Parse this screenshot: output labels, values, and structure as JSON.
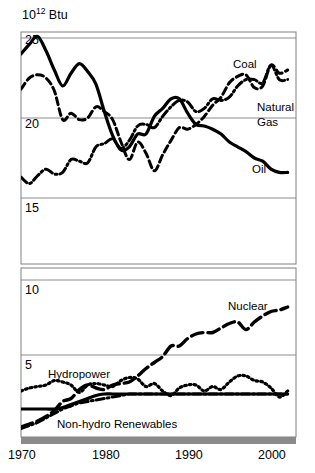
{
  "figure": {
    "unit_title": "10",
    "unit_exponent": "12",
    "unit_suffix": " Btu"
  },
  "chart_data": {
    "type": "line",
    "xlabel": "",
    "ylabel": "10^12 Btu",
    "grid": true,
    "legend": "inline-labels",
    "xlim": [
      1970,
      2003
    ],
    "x_ticks": [
      1970,
      1980,
      1990,
      2000
    ],
    "y_ticks_upper": [
      25,
      20,
      15
    ],
    "y_ticks_lower": [
      10,
      5
    ],
    "axis_break": true,
    "panels": [
      {
        "name": "upper",
        "ylim": [
          13.2,
          26.6
        ],
        "gridlines": [
          25,
          20,
          15
        ]
      },
      {
        "name": "lower",
        "ylim": [
          0.0,
          11.2
        ],
        "gridlines": [
          10,
          5
        ]
      }
    ],
    "x": [
      1970,
      1971,
      1972,
      1973,
      1974,
      1975,
      1976,
      1977,
      1978,
      1979,
      1980,
      1981,
      1982,
      1983,
      1984,
      1985,
      1986,
      1987,
      1988,
      1989,
      1990,
      1991,
      1992,
      1993,
      1994,
      1995,
      1996,
      1997,
      1998,
      1999,
      2000,
      2001,
      2002
    ],
    "series": [
      {
        "name": "Coal",
        "label": "Coal",
        "style": "dash-dot",
        "panel": "upper",
        "values": [
          12.7,
          12.0,
          12.4,
          13.2,
          12.9,
          12.7,
          13.6,
          13.9,
          13.8,
          15.0,
          15.4,
          16.0,
          15.3,
          15.9,
          17.1,
          17.5,
          17.3,
          18.0,
          18.8,
          19.1,
          19.2,
          18.8,
          19.1,
          19.8,
          19.9,
          20.1,
          21.0,
          21.4,
          21.6,
          21.6,
          22.6,
          21.9,
          21.9
        ],
        "display_values": [
          16.3,
          15.9,
          16.4,
          16.8,
          16.5,
          16.6,
          17.4,
          17.3,
          17.2,
          18.2,
          18.4,
          18.7,
          18.1,
          18.6,
          19.5,
          19.6,
          19.4,
          20.1,
          20.7,
          21.1,
          21.0,
          20.4,
          20.6,
          21.2,
          21.1,
          21.3,
          22.0,
          22.4,
          22.4,
          22.2,
          23.3,
          22.4,
          22.4
        ]
      },
      {
        "name": "Natural Gas",
        "label": "Natural Gas",
        "style": "dashed",
        "panel": "upper",
        "values": [
          21.8,
          22.5,
          22.7,
          22.5,
          21.7,
          19.9,
          20.3,
          19.9,
          20.0,
          20.7,
          20.4,
          19.9,
          18.5,
          17.4,
          18.5,
          17.8,
          16.7,
          17.7,
          18.6,
          19.4,
          19.3,
          19.6,
          20.1,
          20.8,
          21.3,
          22.2,
          22.6,
          22.7,
          21.9,
          22.0,
          23.3,
          22.8,
          23.0
        ],
        "display_values": [
          21.8,
          22.5,
          22.7,
          22.5,
          21.7,
          19.9,
          20.3,
          19.9,
          20.0,
          20.7,
          20.4,
          19.9,
          18.5,
          17.4,
          18.5,
          17.8,
          16.7,
          17.7,
          18.6,
          19.4,
          19.3,
          19.6,
          20.1,
          20.8,
          21.3,
          22.2,
          22.6,
          22.7,
          21.9,
          22.0,
          23.3,
          22.8,
          23.0
        ]
      },
      {
        "name": "Oil",
        "label": "Oil",
        "style": "solid",
        "panel": "upper",
        "values": [
          24.0,
          24.6,
          25.1,
          24.2,
          23.0,
          22.0,
          22.8,
          23.4,
          22.9,
          22.1,
          20.4,
          18.9,
          18.0,
          18.2,
          19.0,
          19.0,
          20.1,
          20.6,
          21.2,
          21.2,
          20.3,
          19.6,
          19.5,
          19.3,
          19.0,
          18.5,
          18.2,
          17.9,
          17.5,
          17.3,
          16.8,
          16.6,
          16.6
        ],
        "display_values": [
          24.0,
          24.6,
          25.1,
          24.2,
          23.0,
          22.0,
          22.8,
          23.4,
          22.9,
          22.1,
          20.4,
          18.9,
          18.0,
          18.2,
          19.0,
          19.0,
          20.1,
          20.6,
          21.2,
          21.2,
          20.3,
          19.6,
          19.5,
          19.3,
          19.0,
          18.5,
          18.2,
          17.9,
          17.5,
          17.3,
          16.8,
          16.6,
          16.6
        ]
      },
      {
        "name": "Nuclear",
        "label": "Nuclear",
        "style": "long-dash",
        "panel": "lower",
        "values": [
          0.2,
          0.4,
          0.6,
          0.9,
          1.3,
          1.9,
          2.1,
          2.7,
          3.0,
          2.8,
          2.7,
          3.0,
          3.1,
          3.2,
          3.6,
          4.1,
          4.5,
          4.9,
          5.6,
          5.6,
          6.1,
          6.4,
          6.5,
          6.5,
          6.8,
          7.1,
          7.2,
          6.7,
          7.2,
          7.6,
          7.9,
          8.0,
          8.2
        ],
        "display_values": [
          0.2,
          0.4,
          0.6,
          0.9,
          1.3,
          1.9,
          2.1,
          2.7,
          3.0,
          2.8,
          2.7,
          3.0,
          3.1,
          3.2,
          3.6,
          4.1,
          4.5,
          4.9,
          5.6,
          5.6,
          6.1,
          6.4,
          6.5,
          6.5,
          6.8,
          7.1,
          7.2,
          6.7,
          7.2,
          7.6,
          7.9,
          8.0,
          8.2
        ]
      },
      {
        "name": "Hydropower",
        "label": "Hydropower",
        "style": "dotted",
        "panel": "lower",
        "values": [
          2.6,
          2.8,
          2.9,
          3.0,
          3.3,
          3.2,
          3.0,
          2.5,
          3.0,
          3.1,
          3.0,
          2.9,
          3.3,
          3.5,
          3.4,
          2.9,
          3.1,
          2.6,
          2.3,
          2.8,
          3.0,
          3.0,
          2.6,
          2.9,
          2.7,
          3.2,
          3.6,
          3.6,
          3.3,
          3.2,
          2.8,
          2.2,
          2.6
        ],
        "display_values": [
          2.6,
          2.8,
          2.9,
          3.0,
          3.3,
          3.2,
          3.0,
          2.5,
          3.0,
          3.1,
          3.0,
          2.9,
          3.3,
          3.5,
          3.4,
          2.9,
          3.1,
          2.6,
          2.3,
          2.8,
          3.0,
          3.0,
          2.6,
          2.9,
          2.7,
          3.2,
          3.6,
          3.6,
          3.3,
          3.2,
          2.8,
          2.2,
          2.6
        ]
      },
      {
        "name": "Non-hydro Renewables",
        "label": "Non-hydro Renewables",
        "style": "dash-dot",
        "panel": "lower",
        "values": [
          0.1,
          0.3,
          0.5,
          0.8,
          1.1,
          1.4,
          1.6,
          1.8,
          1.9,
          2.0,
          2.1,
          2.2,
          2.3,
          2.4,
          2.4,
          2.4,
          2.4,
          2.4,
          2.4,
          2.4,
          2.4,
          2.4,
          2.4,
          2.4,
          2.4,
          2.4,
          2.4,
          2.4,
          2.4,
          2.4,
          2.4,
          2.4,
          2.4
        ],
        "display_values": [
          0.1,
          0.3,
          0.5,
          0.8,
          1.1,
          1.4,
          1.6,
          1.8,
          1.9,
          2.0,
          2.1,
          2.2,
          2.3,
          2.4,
          2.4,
          2.4,
          2.4,
          2.4,
          2.4,
          2.4,
          2.4,
          2.4,
          2.4,
          2.4,
          2.4,
          2.4,
          2.4,
          2.4,
          2.4,
          2.4,
          2.4,
          2.4,
          2.4
        ]
      },
      {
        "name": "Other (solid lower)",
        "label": "",
        "style": "solid",
        "panel": "lower",
        "values": [
          1.4,
          1.4,
          1.4,
          1.4,
          1.4,
          1.5,
          1.7,
          1.9,
          2.1,
          2.3,
          2.4,
          2.4,
          2.4,
          2.4,
          2.4,
          2.4,
          2.4,
          2.4,
          2.4,
          2.4,
          2.4,
          2.4,
          2.4,
          2.4,
          2.4,
          2.4,
          2.4,
          2.4,
          2.4,
          2.4,
          2.4,
          2.4,
          2.4
        ],
        "display_values": [
          1.4,
          1.4,
          1.4,
          1.4,
          1.4,
          1.5,
          1.7,
          1.9,
          2.1,
          2.3,
          2.4,
          2.4,
          2.4,
          2.4,
          2.4,
          2.4,
          2.4,
          2.4,
          2.4,
          2.4,
          2.4,
          2.4,
          2.4,
          2.4,
          2.4,
          2.4,
          2.4,
          2.4,
          2.4,
          2.4,
          2.4,
          2.4,
          2.4
        ]
      }
    ],
    "y_axis_labels": [
      {
        "text": "25",
        "value": 25,
        "panel": "upper"
      },
      {
        "text": "20",
        "value": 20,
        "panel": "upper"
      },
      {
        "text": "15",
        "value": 15,
        "panel": "upper"
      },
      {
        "text": "10",
        "value": 10,
        "panel": "lower"
      },
      {
        "text": "5",
        "value": 5,
        "panel": "lower"
      }
    ],
    "x_axis_labels": [
      {
        "text": "1970",
        "value": 1970
      },
      {
        "text": "1980",
        "value": 1980
      },
      {
        "text": "1990",
        "value": 1990
      },
      {
        "text": "2000",
        "value": 2000
      }
    ],
    "series_labels": [
      {
        "text": "Coal"
      },
      {
        "text": "Natural"
      },
      {
        "text": "Gas"
      },
      {
        "text": "Oil"
      },
      {
        "text": "Nuclear"
      },
      {
        "text": "Hydropower"
      },
      {
        "text": "Non-hydro Renewables"
      }
    ],
    "colors": {
      "line": "#000000",
      "grid": "#808080",
      "frame": "#808080",
      "baseband": "#8a8a8a",
      "background": "#ffffff"
    }
  }
}
